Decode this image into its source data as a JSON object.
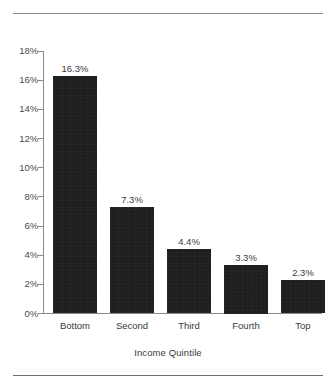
{
  "figure": {
    "background_color": "#ffffff",
    "rule_color": "#8d8d8d",
    "bar_color": "#1b1b1b",
    "axis_color": "#8a8a8a",
    "text_color": "#3a3a3a"
  },
  "chart_data": {
    "type": "bar",
    "title": "",
    "xlabel": "Income Quintile",
    "ylabel": "",
    "categories": [
      "Bottom",
      "Second",
      "Third",
      "Fourth",
      "Top"
    ],
    "values": [
      16.3,
      7.3,
      4.4,
      3.3,
      2.3
    ],
    "value_labels": [
      "16.3%",
      "7.3%",
      "4.4%",
      "3.3%",
      "2.3%"
    ],
    "ylim": [
      0,
      18
    ],
    "ytick_values": [
      0,
      2,
      4,
      6,
      8,
      10,
      12,
      14,
      16,
      18
    ],
    "ytick_labels": [
      "0%",
      "2%",
      "4%",
      "6%",
      "8%",
      "10%",
      "12%",
      "14%",
      "16%",
      "18%"
    ],
    "grid": false,
    "legend": null,
    "orientation": "vertical"
  }
}
